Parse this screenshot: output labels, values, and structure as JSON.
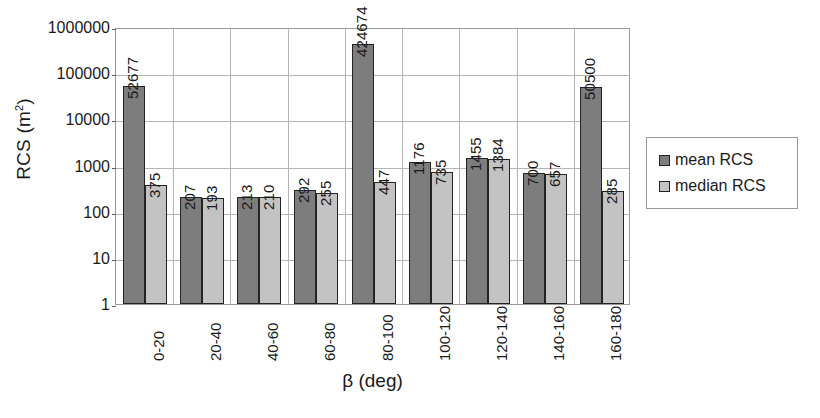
{
  "chart_data": {
    "type": "bar",
    "title": "",
    "xlabel": "β (deg)",
    "ylabel": "RCS (m²)",
    "ylabel_base": "RCS (m",
    "ylabel_sup": "2",
    "ylabel_close": ")",
    "yscale": "log",
    "ylim": [
      1,
      1000000
    ],
    "ytick_labels": [
      "1000000",
      "100000",
      "10000",
      "1000",
      "100",
      "10",
      "1"
    ],
    "ytick_values": [
      1000000,
      100000,
      10000,
      1000,
      100,
      10,
      1
    ],
    "grid": true,
    "legend_position": "right",
    "categories": [
      "0-20",
      "20-40",
      "40-60",
      "60-80",
      "80-100",
      "100-120",
      "120-140",
      "140-160",
      "160-180"
    ],
    "series": [
      {
        "name": "mean RCS",
        "color": "#7d7d7d",
        "values": [
          52677,
          207,
          213,
          292,
          424674,
          1176,
          1455,
          700,
          50500
        ],
        "labels": [
          "52677",
          "207",
          "213",
          "292",
          "424674",
          "1176",
          "1455",
          "700",
          "50500"
        ]
      },
      {
        "name": "median RCS",
        "color": "#c3c3c3",
        "values": [
          375,
          193,
          210,
          255,
          447,
          735,
          1384,
          657,
          285
        ],
        "labels": [
          "375",
          "193",
          "210",
          "255",
          "447",
          "735",
          "1384",
          "657",
          "285"
        ]
      }
    ]
  },
  "legend": {
    "items": [
      {
        "label": "mean RCS",
        "color": "#7d7d7d"
      },
      {
        "label": "median RCS",
        "color": "#c3c3c3"
      }
    ]
  },
  "colors": {
    "mean": "#7d7d7d",
    "median": "#c3c3c3",
    "grid": "#b5b5b5",
    "axis": "#9a9a9a",
    "bar_border": "#232323",
    "text": "#1a1a1a",
    "background": "#ffffff"
  }
}
